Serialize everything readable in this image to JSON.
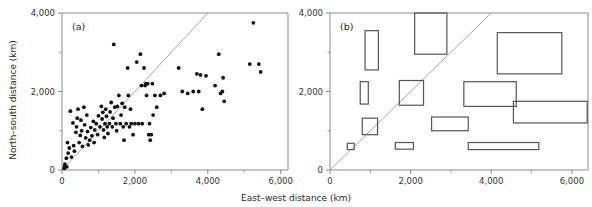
{
  "figure": {
    "title": "",
    "panels": [
      "a",
      "b"
    ]
  },
  "axes": {
    "xlabel": "East–west distance (km)",
    "ylabel": "North–south distance (km)",
    "xticklabels": [
      "0",
      "2,000",
      "4,000",
      "6,000"
    ],
    "yticklabels": [
      "0",
      "2,000",
      "4,000"
    ],
    "xtickvalues": [
      0,
      2000,
      4000,
      6000
    ],
    "ytickvalues": [
      0,
      2000,
      4000
    ],
    "xminorticks": [
      1000,
      3000,
      5000
    ],
    "yminorticks": [
      1000,
      3000
    ],
    "xlim": [
      0,
      6200
    ],
    "ylim": [
      0,
      4000
    ],
    "grid": false,
    "colors": {
      "axis": "#8a8a8a",
      "point": "#111111",
      "box": "#555555",
      "diagonal": "#9b9b9b"
    }
  },
  "chart_data": [
    {
      "type": "scatter",
      "panel_label": "(a)",
      "title": "",
      "xlabel": "East–west distance (km)",
      "ylabel": "North–south distance (km)",
      "xlim": [
        0,
        6200
      ],
      "ylim": [
        0,
        4000
      ],
      "grid": false,
      "legend": "none",
      "annotations": [
        "1:1 reference line (y = x)"
      ],
      "reference_line": {
        "type": "identity",
        "x0": 0,
        "y0": 0,
        "x1": 4000,
        "y1": 4000
      },
      "points": [
        [
          60,
          40
        ],
        [
          70,
          90
        ],
        [
          80,
          150
        ],
        [
          120,
          300
        ],
        [
          130,
          80
        ],
        [
          150,
          700
        ],
        [
          170,
          430
        ],
        [
          200,
          560
        ],
        [
          230,
          1500
        ],
        [
          260,
          330
        ],
        [
          300,
          1200
        ],
        [
          320,
          620
        ],
        [
          340,
          480
        ],
        [
          380,
          960
        ],
        [
          400,
          1100
        ],
        [
          420,
          1320
        ],
        [
          440,
          1550
        ],
        [
          470,
          700
        ],
        [
          500,
          880
        ],
        [
          520,
          1270
        ],
        [
          540,
          1000
        ],
        [
          560,
          600
        ],
        [
          600,
          1600
        ],
        [
          620,
          1150
        ],
        [
          650,
          820
        ],
        [
          680,
          1400
        ],
        [
          700,
          980
        ],
        [
          720,
          640
        ],
        [
          760,
          760
        ],
        [
          790,
          1080
        ],
        [
          820,
          870
        ],
        [
          860,
          1240
        ],
        [
          880,
          700
        ],
        [
          900,
          1020
        ],
        [
          940,
          1180
        ],
        [
          980,
          900
        ],
        [
          1000,
          1380
        ],
        [
          1040,
          1100
        ],
        [
          1080,
          1620
        ],
        [
          1100,
          1300
        ],
        [
          1120,
          1470
        ],
        [
          1140,
          1020
        ],
        [
          1160,
          830
        ],
        [
          1180,
          1180
        ],
        [
          1200,
          1550
        ],
        [
          1220,
          1370
        ],
        [
          1240,
          1100
        ],
        [
          1260,
          930
        ],
        [
          1300,
          1180
        ],
        [
          1320,
          1480
        ],
        [
          1350,
          1720
        ],
        [
          1380,
          1100
        ],
        [
          1400,
          1320
        ],
        [
          1420,
          3200
        ],
        [
          1450,
          1600
        ],
        [
          1480,
          1180
        ],
        [
          1500,
          1000
        ],
        [
          1520,
          1620
        ],
        [
          1560,
          1900
        ],
        [
          1600,
          1180
        ],
        [
          1620,
          1400
        ],
        [
          1650,
          1700
        ],
        [
          1680,
          1100
        ],
        [
          1700,
          760
        ],
        [
          1720,
          1600
        ],
        [
          1760,
          1180
        ],
        [
          1800,
          2600
        ],
        [
          1820,
          1900
        ],
        [
          1850,
          1100
        ],
        [
          1880,
          1550
        ],
        [
          1900,
          1180
        ],
        [
          1950,
          900
        ],
        [
          2000,
          1180
        ],
        [
          2050,
          2750
        ],
        [
          2100,
          1180
        ],
        [
          2150,
          2950
        ],
        [
          2180,
          2150
        ],
        [
          2200,
          1180
        ],
        [
          2250,
          2600
        ],
        [
          2280,
          2150
        ],
        [
          2300,
          2200
        ],
        [
          2320,
          1900
        ],
        [
          2350,
          2200
        ],
        [
          2380,
          900
        ],
        [
          2400,
          1180
        ],
        [
          2420,
          760
        ],
        [
          2450,
          900
        ],
        [
          2480,
          2200
        ],
        [
          2500,
          1400
        ],
        [
          2550,
          1900
        ],
        [
          2600,
          1600
        ],
        [
          2700,
          1900
        ],
        [
          2800,
          1950
        ],
        [
          3200,
          2600
        ],
        [
          3300,
          2000
        ],
        [
          3450,
          1950
        ],
        [
          3600,
          2000
        ],
        [
          3700,
          2450
        ],
        [
          3750,
          2000
        ],
        [
          3800,
          2420
        ],
        [
          3850,
          1550
        ],
        [
          3950,
          2400
        ],
        [
          4200,
          2150
        ],
        [
          4300,
          2950
        ],
        [
          4350,
          1950
        ],
        [
          4400,
          2000
        ],
        [
          4420,
          2350
        ],
        [
          4450,
          1750
        ],
        [
          5150,
          2700
        ],
        [
          5250,
          3750
        ],
        [
          5400,
          2700
        ],
        [
          5450,
          2500
        ]
      ]
    },
    {
      "type": "box",
      "panel_label": "(b)",
      "title": "",
      "xlabel": "East–west distance (km)",
      "ylabel": "North–south distance (km)",
      "xlim": [
        0,
        6400
      ],
      "ylim": [
        0,
        4000
      ],
      "grid": false,
      "legend": "none",
      "annotations": [
        "1:1 reference line (y = x)"
      ],
      "reference_line": {
        "type": "identity",
        "x0": 0,
        "y0": 0,
        "x1": 4000,
        "y1": 4000
      },
      "boxes": [
        {
          "x0": 430,
          "x1": 600,
          "y0": 520,
          "y1": 680
        },
        {
          "x0": 800,
          "x1": 1180,
          "y0": 900,
          "y1": 1320
        },
        {
          "x0": 750,
          "x1": 950,
          "y0": 1680,
          "y1": 2250
        },
        {
          "x0": 870,
          "x1": 1200,
          "y0": 2550,
          "y1": 3550
        },
        {
          "x0": 1620,
          "x1": 2070,
          "y0": 530,
          "y1": 700
        },
        {
          "x0": 1720,
          "x1": 2320,
          "y0": 1650,
          "y1": 2280
        },
        {
          "x0": 2100,
          "x1": 2900,
          "y0": 2950,
          "y1": 4000
        },
        {
          "x0": 2520,
          "x1": 3430,
          "y0": 1000,
          "y1": 1350
        },
        {
          "x0": 3320,
          "x1": 4620,
          "y0": 1620,
          "y1": 2250
        },
        {
          "x0": 3430,
          "x1": 5180,
          "y0": 520,
          "y1": 700
        },
        {
          "x0": 4150,
          "x1": 5750,
          "y0": 2450,
          "y1": 3500
        },
        {
          "x0": 4550,
          "x1": 6380,
          "y0": 1200,
          "y1": 1750
        }
      ]
    }
  ]
}
